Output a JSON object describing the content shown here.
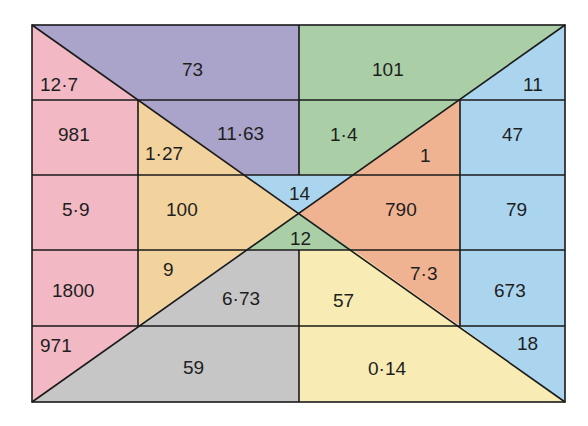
{
  "diagram": {
    "title": "",
    "frame": {
      "left": 32,
      "top": 25,
      "right": 565,
      "bottom": 402
    },
    "colors": {
      "pink": "#f2b9c5",
      "purple": "#aaa4ca",
      "green": "#aacfa6",
      "blue": "#abd5ef",
      "orange": "#f0b392",
      "tan": "#f3d39d",
      "gray": "#c6c6c6",
      "yellow": "#f8ebb3",
      "line": "#1a1a1a"
    },
    "labels": {
      "top_left_pink": "12·7",
      "top_purple": "73",
      "top_green": "101",
      "top_right_blue": "11",
      "r2_pink": "981",
      "r2_tan": "1·27",
      "r2_purple": "11·63",
      "r2_green": "1·4",
      "r2_orange": "1",
      "r2_blue": "47",
      "center_blue": "14",
      "r3_pink": "5·9",
      "r3_tan": "100",
      "r3_orange": "790",
      "r3_blue": "79",
      "center_green": "12",
      "r4_pink": "1800",
      "r4_tan": "9",
      "r4_gray": "6·73",
      "r4_yellow": "57",
      "r4_orange": "7·3",
      "r4_blue": "673",
      "bottom_left_pink": "971",
      "bottom_gray": "59",
      "bottom_yellow": "0·14",
      "bottom_right_blue": "18"
    }
  }
}
